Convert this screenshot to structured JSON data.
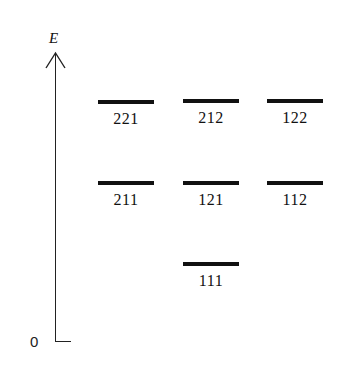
{
  "diagram": {
    "axis": {
      "label": "E",
      "origin_label": "0"
    },
    "levels": [
      {
        "label": "221",
        "x": 98,
        "y": 100,
        "row": "top"
      },
      {
        "label": "212",
        "x": 183,
        "y": 99,
        "row": "top"
      },
      {
        "label": "122",
        "x": 267,
        "y": 99,
        "row": "top"
      },
      {
        "label": "211",
        "x": 98,
        "y": 181,
        "row": "middle"
      },
      {
        "label": "121",
        "x": 183,
        "y": 181,
        "row": "middle"
      },
      {
        "label": "112",
        "x": 267,
        "y": 181,
        "row": "middle"
      },
      {
        "label": "111",
        "x": 183,
        "y": 262,
        "row": "bottom"
      }
    ]
  }
}
